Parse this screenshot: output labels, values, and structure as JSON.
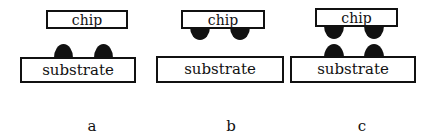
{
  "figure": {
    "panels": [
      {
        "id": "a",
        "label": "a",
        "chip_label": "chip",
        "substrate_label": "substrate",
        "bumps": "on substrate"
      },
      {
        "id": "b",
        "label": "b",
        "chip_label": "chip",
        "substrate_label": "substrate",
        "bumps": "on chip"
      },
      {
        "id": "c",
        "label": "c",
        "chip_label": "chip",
        "substrate_label": "substrate",
        "bumps": "on chip and substrate"
      }
    ]
  },
  "colors": {
    "ink": "#111111",
    "background": "#ffffff"
  }
}
